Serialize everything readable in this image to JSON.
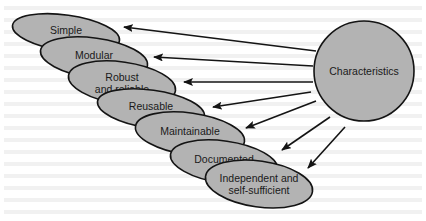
{
  "diagram": {
    "hub": {
      "label": "Characteristics",
      "cx": 364,
      "cy": 71,
      "r": 50
    },
    "colors": {
      "fill": "#b3b3b3",
      "stroke": "#141414",
      "arrow": "#141414",
      "text": "#1a1a1a",
      "background": "#ffffff"
    },
    "nodes": [
      {
        "id": "simple",
        "lines": [
          "Simple"
        ],
        "cx": 66,
        "cy": 33,
        "rx": 54,
        "ry": 18
      },
      {
        "id": "modular",
        "lines": [
          "Modular"
        ],
        "cx": 94,
        "cy": 58,
        "rx": 54,
        "ry": 20
      },
      {
        "id": "robust",
        "lines": [
          "Robust",
          "and reliable"
        ],
        "cx": 122,
        "cy": 83,
        "rx": 54,
        "ry": 21
      },
      {
        "id": "reusable",
        "lines": [
          "Reusable"
        ],
        "cx": 151,
        "cy": 109,
        "rx": 54,
        "ry": 19
      },
      {
        "id": "maintainable",
        "lines": [
          "Maintainable"
        ],
        "cx": 190,
        "cy": 134,
        "rx": 55,
        "ry": 21
      },
      {
        "id": "documented",
        "lines": [
          "Documented"
        ],
        "cx": 224,
        "cy": 162,
        "rx": 54,
        "ry": 21
      },
      {
        "id": "independent",
        "lines": [
          "Independent and",
          "self-sufficient"
        ],
        "cx": 259,
        "cy": 184,
        "rx": 54,
        "ry": 23
      }
    ],
    "arrows": [
      {
        "to": "simple",
        "x1": 316,
        "y1": 51,
        "x2": 124,
        "y2": 27
      },
      {
        "to": "modular",
        "x1": 313,
        "y1": 66,
        "x2": 154,
        "y2": 57
      },
      {
        "to": "robust",
        "x1": 313,
        "y1": 82,
        "x2": 184,
        "y2": 82
      },
      {
        "to": "reusable",
        "x1": 311,
        "y1": 92,
        "x2": 213,
        "y2": 107
      },
      {
        "to": "maintainable",
        "x1": 316,
        "y1": 101,
        "x2": 246,
        "y2": 128
      },
      {
        "to": "documented",
        "x1": 330,
        "y1": 117,
        "x2": 282,
        "y2": 150
      },
      {
        "to": "independent",
        "x1": 345,
        "y1": 127,
        "x2": 308,
        "y2": 168
      }
    ]
  }
}
